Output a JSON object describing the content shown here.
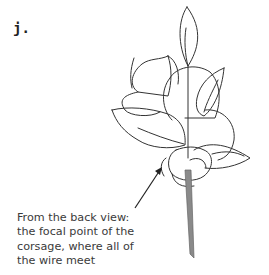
{
  "figure": {
    "step_label": "j.",
    "caption": {
      "lines": [
        "From the back view:",
        "the focal point of the",
        "corsage, where all of",
        "the wire meet"
      ]
    },
    "illustration": {
      "subject": "corsage-back-view",
      "line_color": "#333333",
      "stem_color": "#8a8a8a"
    }
  }
}
